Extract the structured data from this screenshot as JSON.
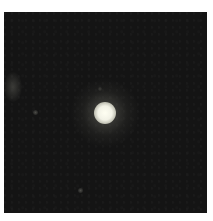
{
  "image": {
    "subject": "single bright star on dark sky background",
    "background_color": "#141414",
    "border_color": "#ffffff",
    "objects": [
      {
        "name": "bright-star",
        "center": [
          105,
          113
        ],
        "core_diameter": 20
      },
      {
        "name": "faint-source-left-edge",
        "center": [
          8,
          75
        ]
      },
      {
        "name": "faint-source",
        "center": [
          32,
          100
        ]
      },
      {
        "name": "faint-source",
        "center": [
          77,
          178
        ]
      },
      {
        "name": "faint-source",
        "center": [
          96,
          77
        ]
      }
    ]
  }
}
